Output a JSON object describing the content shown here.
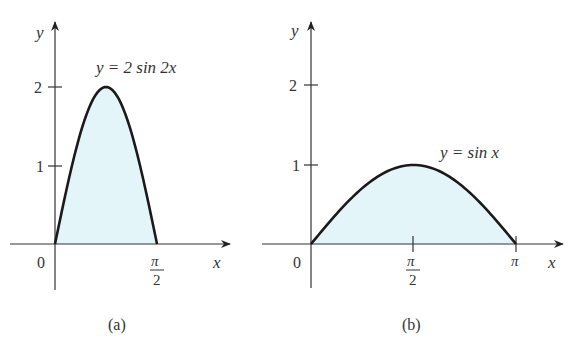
{
  "chart_data": [
    {
      "type": "area",
      "panel_label": "(a)",
      "function_label": "y = 2 sin 2x",
      "xlabel": "x",
      "ylabel": "y",
      "x_ticks": [
        {
          "value": 0,
          "label": "0"
        },
        {
          "value": 1.5708,
          "label": "π/2"
        }
      ],
      "y_ticks": [
        {
          "value": 1,
          "label": "1"
        },
        {
          "value": 2,
          "label": "2"
        }
      ],
      "xlim": [
        0,
        1.5708
      ],
      "ylim": [
        0,
        2
      ],
      "x": [
        0,
        0.19635,
        0.3927,
        0.58905,
        0.7854,
        0.98175,
        1.1781,
        1.37445,
        1.5708
      ],
      "values": [
        0,
        0.765,
        1.414,
        1.848,
        2,
        1.848,
        1.414,
        0.765,
        0
      ],
      "shaded": true,
      "grid": false
    },
    {
      "type": "area",
      "panel_label": "(b)",
      "function_label": "y = sin x",
      "xlabel": "x",
      "ylabel": "y",
      "x_ticks": [
        {
          "value": 0,
          "label": "0"
        },
        {
          "value": 1.5708,
          "label": "π/2"
        },
        {
          "value": 3.1416,
          "label": "π"
        }
      ],
      "y_ticks": [
        {
          "value": 1,
          "label": "1"
        },
        {
          "value": 2,
          "label": "2"
        }
      ],
      "xlim": [
        0,
        3.1416
      ],
      "ylim": [
        0,
        2
      ],
      "x": [
        0,
        0.3927,
        0.7854,
        1.1781,
        1.5708,
        1.9635,
        2.3562,
        2.7489,
        3.1416
      ],
      "values": [
        0,
        0.383,
        0.707,
        0.924,
        1,
        0.924,
        0.707,
        0.383,
        0
      ],
      "shaded": true,
      "grid": false
    }
  ],
  "panels": {
    "a": {
      "caption": "(a)",
      "equation": "y = 2 sin 2x",
      "axis_x": "x",
      "axis_y": "y",
      "origin": "0",
      "tick_y1": "1",
      "tick_y2": "2",
      "tick_x_num": "π",
      "tick_x_den": "2"
    },
    "b": {
      "caption": "(b)",
      "equation": "y = sin x",
      "axis_x": "x",
      "axis_y": "y",
      "origin": "0",
      "tick_y1": "1",
      "tick_y2": "2",
      "tick_x_half_num": "π",
      "tick_x_half_den": "2",
      "tick_x_pi": "π"
    }
  },
  "colors": {
    "fill": "#e4f5fa",
    "curve": "#1a1a1a",
    "axis": "#333333"
  }
}
